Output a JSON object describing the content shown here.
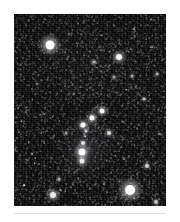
{
  "page": {
    "background_color": "#ffffff",
    "frame": {
      "x": 14,
      "y": 14,
      "width": 152,
      "height": 192,
      "border_color": "#ffffff"
    },
    "divider_color": "#e2e2e2"
  },
  "image": {
    "kind": "astrophotograph",
    "subject": "Orion",
    "sky_color": "#030303",
    "star_color": "#ffffff",
    "field_noise": "dense-speckle-starfield"
  },
  "chart_data": {
    "type": "scatter",
    "xlabel": "",
    "ylabel": "",
    "xlim": [
      0,
      152
    ],
    "ylim": [
      0,
      192
    ],
    "grid": false,
    "legend": "none",
    "background": "#030303",
    "point_color": "#ffffff",
    "series": [
      {
        "name": "bright stars",
        "points": [
          {
            "label": "Betelgeuse",
            "x": 36,
            "y": 31,
            "size": 9,
            "brightness": 1.0
          },
          {
            "label": "Bellatrix",
            "x": 105,
            "y": 43,
            "size": 6,
            "brightness": 0.86
          },
          {
            "label": "Rigel",
            "x": 116,
            "y": 176,
            "size": 10,
            "brightness": 1.0
          },
          {
            "label": "Saiph",
            "x": 39,
            "y": 181,
            "size": 6,
            "brightness": 0.82
          },
          {
            "label": "Alnitak",
            "x": 69,
            "y": 111,
            "size": 5,
            "brightness": 0.9
          },
          {
            "label": "Alnilam",
            "x": 78,
            "y": 104,
            "size": 5,
            "brightness": 0.9
          },
          {
            "label": "Mintaka",
            "x": 88,
            "y": 97,
            "size": 5,
            "brightness": 0.88
          },
          {
            "label": "Orion Nebula",
            "x": 68,
            "y": 138,
            "size": 7,
            "brightness": 0.95
          },
          {
            "label": "Hatsya",
            "x": 68,
            "y": 147,
            "size": 5,
            "brightness": 0.8
          },
          {
            "label": "Sword upper",
            "x": 69,
            "y": 129,
            "size": 4,
            "brightness": 0.72
          },
          {
            "label": "Eta Orionis",
            "x": 95,
            "y": 119,
            "size": 4,
            "brightness": 0.7
          },
          {
            "label": "Tabit",
            "x": 133,
            "y": 152,
            "size": 4,
            "brightness": 0.68
          },
          {
            "label": "Pi3 Orionis",
            "x": 130,
            "y": 85,
            "size": 3,
            "brightness": 0.55
          },
          {
            "label": "Meissa",
            "x": 80,
            "y": 48,
            "size": 3,
            "brightness": 0.5
          },
          {
            "label": "Nu Orionis",
            "x": 143,
            "y": 60,
            "size": 3,
            "brightness": 0.5
          },
          {
            "label": "Tau Orionis",
            "x": 45,
            "y": 165,
            "size": 3,
            "brightness": 0.5
          },
          {
            "label": "Cursa",
            "x": 142,
            "y": 188,
            "size": 4,
            "brightness": 0.6
          },
          {
            "label": "Mu Orionis",
            "x": 118,
            "y": 62,
            "size": 3,
            "brightness": 0.45
          },
          {
            "label": "Phi Orionis",
            "x": 100,
            "y": 63,
            "size": 3,
            "brightness": 0.45
          },
          {
            "label": "Omega Orionis",
            "x": 52,
            "y": 119,
            "size": 3,
            "brightness": 0.42
          },
          {
            "label": "Sigma Orionis",
            "x": 72,
            "y": 117,
            "size": 3,
            "brightness": 0.6
          },
          {
            "label": "field star a",
            "x": 23,
            "y": 70,
            "size": 2,
            "brightness": 0.4
          },
          {
            "label": "field star b",
            "x": 120,
            "y": 15,
            "size": 2,
            "brightness": 0.4
          },
          {
            "label": "field star c",
            "x": 18,
            "y": 140,
            "size": 2,
            "brightness": 0.35
          },
          {
            "label": "field star d",
            "x": 146,
            "y": 120,
            "size": 2,
            "brightness": 0.35
          },
          {
            "label": "field star e",
            "x": 60,
            "y": 80,
            "size": 2,
            "brightness": 0.35
          },
          {
            "label": "field star f",
            "x": 110,
            "y": 145,
            "size": 2,
            "brightness": 0.35
          },
          {
            "label": "field star g",
            "x": 30,
            "y": 100,
            "size": 2,
            "brightness": 0.3
          },
          {
            "label": "field star h",
            "x": 90,
            "y": 170,
            "size": 2,
            "brightness": 0.3
          },
          {
            "label": "field star i",
            "x": 137,
            "y": 33,
            "size": 2,
            "brightness": 0.3
          },
          {
            "label": "field star j",
            "x": 55,
            "y": 20,
            "size": 2,
            "brightness": 0.3
          }
        ]
      }
    ]
  }
}
